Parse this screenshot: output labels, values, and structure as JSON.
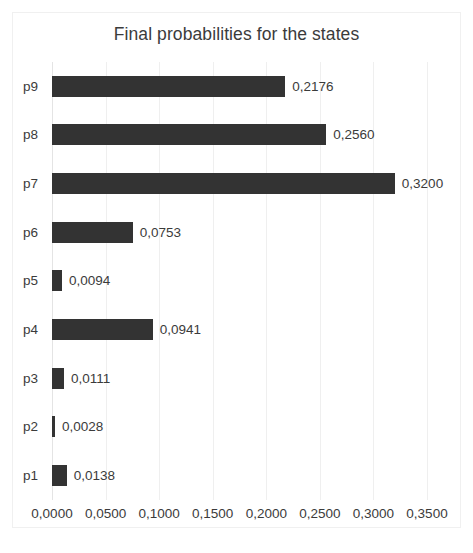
{
  "chart_data": {
    "type": "bar",
    "orientation": "horizontal",
    "title": "Final probabilities for the states",
    "xlabel": "",
    "ylabel": "",
    "categories": [
      "p9",
      "p8",
      "p7",
      "p6",
      "p5",
      "p4",
      "p3",
      "p2",
      "p1"
    ],
    "values": [
      0.2176,
      0.256,
      0.32,
      0.0753,
      0.0094,
      0.0941,
      0.0111,
      0.0028,
      0.0138
    ],
    "data_labels": [
      "0,2176",
      "0,2560",
      "0,3200",
      "0,0753",
      "0,0094",
      "0,0941",
      "0,0111",
      "0,0028",
      "0,0138"
    ],
    "xlim": [
      0.0,
      0.35
    ],
    "x_ticks": [
      0.0,
      0.05,
      0.1,
      0.15,
      0.2,
      0.25,
      0.3,
      0.35
    ],
    "x_tick_labels": [
      "0,0000",
      "0,0500",
      "0,1000",
      "0,1500",
      "0,2000",
      "0,2500",
      "0,3000",
      "0,3500"
    ],
    "grid": true,
    "grid_axis": "x",
    "legend": false,
    "decimal_separator": ",",
    "bar_color": "#333333",
    "gridline_color": "#efefef",
    "text_color": "#3b3b3b",
    "background_color": "#ffffff"
  }
}
